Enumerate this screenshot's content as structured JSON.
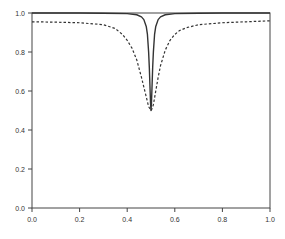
{
  "chart_data": {
    "type": "line",
    "title": "",
    "xlabel": "",
    "ylabel": "",
    "xlim": [
      0.0,
      1.0
    ],
    "ylim": [
      0.0,
      1.0
    ],
    "grid": false,
    "legend": null,
    "xticks": [
      "0.0",
      "0.2",
      "0.4",
      "0.6",
      "0.8",
      "1.0"
    ],
    "yticks": [
      "0.0",
      "0.2",
      "0.4",
      "0.6",
      "0.8",
      "1.0"
    ],
    "series": [
      {
        "name": "solid (narrow dip)",
        "style": "solid",
        "color": "#333333",
        "x": [
          0.0,
          0.1,
          0.2,
          0.3,
          0.4,
          0.44,
          0.46,
          0.47,
          0.48,
          0.485,
          0.49,
          0.493,
          0.496,
          0.498,
          0.5,
          0.502,
          0.504,
          0.507,
          0.51,
          0.515,
          0.52,
          0.53,
          0.54,
          0.56,
          0.6,
          0.7,
          0.8,
          0.9,
          1.0
        ],
        "values": [
          1.0,
          1.0,
          1.0,
          0.999,
          0.997,
          0.991,
          0.98,
          0.966,
          0.931,
          0.89,
          0.8,
          0.72,
          0.61,
          0.54,
          0.5,
          0.54,
          0.61,
          0.72,
          0.8,
          0.89,
          0.931,
          0.966,
          0.98,
          0.991,
          0.997,
          0.999,
          1.0,
          1.0,
          1.0
        ]
      },
      {
        "name": "dashed (broad dip)",
        "style": "dashed",
        "color": "#333333",
        "x": [
          0.0,
          0.1,
          0.2,
          0.3,
          0.35,
          0.38,
          0.4,
          0.42,
          0.44,
          0.46,
          0.47,
          0.48,
          0.49,
          0.495,
          0.5,
          0.505,
          0.51,
          0.52,
          0.53,
          0.54,
          0.56,
          0.58,
          0.6,
          0.62,
          0.65,
          0.7,
          0.8,
          0.9,
          1.0
        ],
        "values": [
          0.955,
          0.953,
          0.95,
          0.94,
          0.92,
          0.89,
          0.86,
          0.82,
          0.76,
          0.67,
          0.62,
          0.57,
          0.52,
          0.51,
          0.5,
          0.51,
          0.53,
          0.6,
          0.67,
          0.73,
          0.81,
          0.86,
          0.89,
          0.91,
          0.925,
          0.94,
          0.95,
          0.955,
          0.96
        ]
      }
    ]
  }
}
